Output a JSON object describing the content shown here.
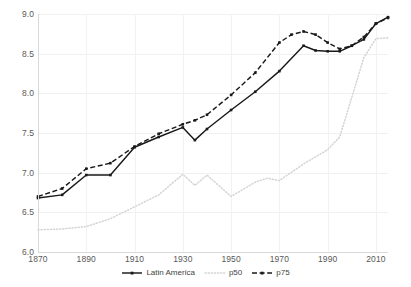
{
  "chart_data": {
    "type": "line",
    "title": "",
    "xlabel": "",
    "ylabel": "",
    "xlim": [
      1870,
      2015
    ],
    "ylim": [
      6.0,
      9.0
    ],
    "grid": true,
    "legend_position": "bottom-center",
    "y_ticks": [
      "6.0",
      "6.5",
      "7.0",
      "7.5",
      "8.0",
      "8.5",
      "9.0"
    ],
    "y_tick_values": [
      6.0,
      6.5,
      7.0,
      7.5,
      8.0,
      8.5,
      9.0
    ],
    "x_ticks": [
      "1870",
      "1890",
      "1910",
      "1930",
      "1950",
      "1970",
      "1990",
      "2010"
    ],
    "x_tick_values": [
      1870,
      1890,
      1910,
      1930,
      1950,
      1970,
      1990,
      2010
    ],
    "series": [
      {
        "name": "Latin America",
        "style": "solid",
        "color": "#1a1a1a",
        "marker": true,
        "x": [
          1870,
          1880,
          1890,
          1900,
          1910,
          1920,
          1930,
          1935,
          1940,
          1950,
          1960,
          1970,
          1980,
          1985,
          1990,
          1995,
          2000,
          2005,
          2010,
          2015
        ],
        "y": [
          6.68,
          6.72,
          6.97,
          6.97,
          7.32,
          7.45,
          7.57,
          7.41,
          7.55,
          7.79,
          8.02,
          8.28,
          8.6,
          8.54,
          8.53,
          8.53,
          8.6,
          8.68,
          8.88,
          8.96
        ]
      },
      {
        "name": "p50",
        "style": "dotted",
        "color": "#d4d4d4",
        "marker": false,
        "x": [
          1870,
          1880,
          1890,
          1900,
          1910,
          1920,
          1930,
          1935,
          1940,
          1950,
          1960,
          1965,
          1970,
          1980,
          1990,
          1995,
          2000,
          2005,
          2010,
          2015
        ],
        "y": [
          6.28,
          6.29,
          6.32,
          6.42,
          6.57,
          6.72,
          6.98,
          6.84,
          6.97,
          6.7,
          6.88,
          6.93,
          6.9,
          7.11,
          7.29,
          7.45,
          7.95,
          8.45,
          8.69,
          8.7
        ]
      },
      {
        "name": "p75",
        "style": "dashed",
        "color": "#1a1a1a",
        "marker": true,
        "x": [
          1870,
          1880,
          1890,
          1900,
          1910,
          1920,
          1930,
          1935,
          1940,
          1950,
          1960,
          1970,
          1975,
          1980,
          1985,
          1990,
          1995,
          2000,
          2005,
          2010,
          2015
        ],
        "y": [
          6.7,
          6.8,
          7.05,
          7.12,
          7.33,
          7.49,
          7.61,
          7.66,
          7.73,
          7.98,
          8.26,
          8.64,
          8.74,
          8.78,
          8.74,
          8.64,
          8.56,
          8.6,
          8.71,
          8.88,
          8.95
        ]
      }
    ]
  },
  "legend": {
    "items": [
      {
        "label": "Latin America",
        "style": "solid",
        "color": "#1a1a1a"
      },
      {
        "label": "p50",
        "style": "dotted",
        "color": "#d4d4d4"
      },
      {
        "label": "p75",
        "style": "dashed",
        "color": "#1a1a1a"
      }
    ]
  }
}
